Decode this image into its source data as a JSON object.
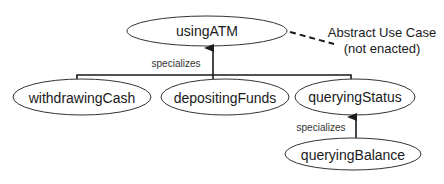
{
  "diagram": {
    "type": "UML use case generalization diagram",
    "colors": {
      "background": "#ffffff",
      "stroke": "#1a1a1a",
      "text": "#1a1a1a"
    },
    "nodes": {
      "using_atm": {
        "label": "usingATM",
        "cx": 207,
        "cy": 31,
        "rx": 80,
        "ry": 15
      },
      "withdrawing_cash": {
        "label": "withdrawingCash",
        "cx": 82,
        "cy": 97,
        "rx": 69,
        "ry": 18
      },
      "depositing_funds": {
        "label": "depositingFunds",
        "cx": 225,
        "cy": 97,
        "rx": 64,
        "ry": 18
      },
      "querying_status": {
        "label": "queryingStatus",
        "cx": 355,
        "cy": 97,
        "rx": 60,
        "ry": 18
      },
      "querying_balance": {
        "label": "queryingBalance",
        "cx": 353,
        "cy": 154,
        "rx": 68,
        "ry": 16
      }
    },
    "edges": {
      "top_generalization": {
        "label": "specializes",
        "from": [
          "withdrawingCash",
          "depositingFunds",
          "queryingStatus"
        ],
        "to": "usingATM"
      },
      "status_generalization": {
        "label": "specializes",
        "from": "queryingBalance",
        "to": "queryingStatus"
      }
    },
    "note": {
      "line1": "Abstract Use Case",
      "line2": "(not enacted)",
      "attached_to": "usingATM"
    }
  }
}
